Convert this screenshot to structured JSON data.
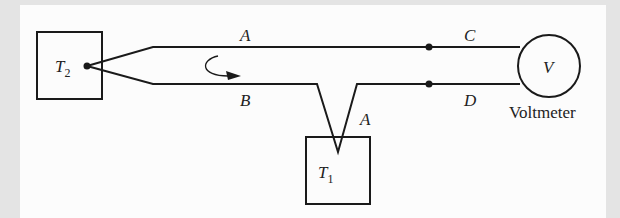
{
  "diagram": {
    "type": "thermocouple circuit",
    "reservoirs": [
      {
        "id": "T2",
        "symbol": "T",
        "subscript": "2"
      },
      {
        "id": "T1",
        "symbol": "T",
        "subscript": "1"
      }
    ],
    "wire_labels": {
      "upper_left": "A",
      "lower_left": "B",
      "junction_right": "A",
      "upper_right": "C",
      "lower_right": "D"
    },
    "meter": {
      "symbol": "V",
      "caption": "Voltmeter"
    },
    "colors": {
      "line": "#1a1a1a",
      "background": "#fcfcfc",
      "border": "#e4e4e4"
    }
  }
}
